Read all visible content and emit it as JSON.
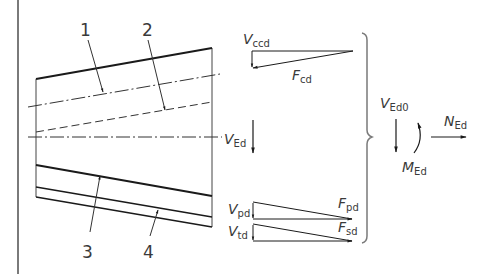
{
  "figure": {
    "type": "structural-force-diagram",
    "callouts": [
      {
        "id": "1",
        "label": "1"
      },
      {
        "id": "2",
        "label": "2"
      },
      {
        "id": "3",
        "label": "3"
      },
      {
        "id": "4",
        "label": "4"
      }
    ],
    "forces": {
      "vccd": {
        "main": "V",
        "sub": "ccd"
      },
      "fcd": {
        "main": "F",
        "sub": "cd"
      },
      "ved": {
        "main": "V",
        "sub": "Ed"
      },
      "vpd": {
        "main": "V",
        "sub": "pd"
      },
      "fpd": {
        "main": "F",
        "sub": "pd"
      },
      "vtd": {
        "main": "V",
        "sub": "td"
      },
      "fsd": {
        "main": "F",
        "sub": "sd"
      },
      "ved0": {
        "main": "V",
        "sub": "Ed0"
      },
      "ned": {
        "main": "N",
        "sub": "Ed"
      },
      "med": {
        "main": "M",
        "sub": "Ed"
      }
    },
    "colors": {
      "line": "#1a1a1a",
      "text": "#3a3a3a",
      "frame": "#7a7a7a",
      "background": "#ffffff"
    }
  }
}
